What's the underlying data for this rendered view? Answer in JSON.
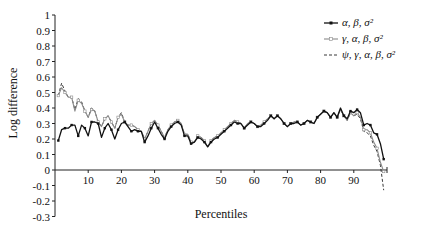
{
  "chart_data": {
    "type": "line",
    "title": "",
    "xlabel": "Percentiles",
    "ylabel": "Log difference",
    "xlim": [
      0,
      100
    ],
    "ylim": [
      -0.3,
      1.0
    ],
    "grid": false,
    "legend_position": "top-right",
    "x_ticks": [
      10,
      20,
      30,
      40,
      50,
      60,
      70,
      80,
      90
    ],
    "y_ticks": [
      1,
      0.9,
      0.8,
      0.7,
      0.6,
      0.5,
      0.4,
      0.3,
      0.2,
      0.1,
      0,
      -0.1,
      -0.2,
      -0.3
    ],
    "y_tick_labels": [
      "1",
      "0.9",
      "0.8",
      "0.7",
      "0.6",
      "0.5",
      "0.4",
      "0.3",
      "0.2",
      "0.1",
      "0",
      "-0.1",
      "-0.2",
      "-0.3"
    ],
    "x": [
      1,
      2,
      3,
      4,
      5,
      6,
      7,
      8,
      9,
      10,
      11,
      12,
      13,
      14,
      15,
      16,
      17,
      18,
      19,
      20,
      21,
      22,
      23,
      24,
      25,
      26,
      27,
      28,
      29,
      30,
      31,
      32,
      33,
      34,
      35,
      36,
      37,
      38,
      39,
      40,
      41,
      42,
      43,
      44,
      45,
      46,
      47,
      48,
      49,
      50,
      51,
      52,
      53,
      54,
      55,
      56,
      57,
      58,
      59,
      60,
      61,
      62,
      63,
      64,
      65,
      66,
      67,
      68,
      69,
      70,
      71,
      72,
      73,
      74,
      75,
      76,
      77,
      78,
      79,
      80,
      81,
      82,
      83,
      84,
      85,
      86,
      87,
      88,
      89,
      90,
      91,
      92,
      93,
      94,
      95,
      96,
      97,
      98,
      99
    ],
    "series": [
      {
        "name": "α, β, σ²",
        "style": "solid-square-marker",
        "values": [
          0.19,
          0.26,
          0.27,
          0.27,
          0.29,
          0.29,
          0.22,
          0.29,
          0.27,
          0.22,
          0.31,
          0.31,
          0.3,
          0.21,
          0.27,
          0.3,
          0.26,
          0.2,
          0.26,
          0.3,
          0.31,
          0.28,
          0.25,
          0.26,
          0.25,
          0.25,
          0.18,
          0.22,
          0.27,
          0.31,
          0.27,
          0.23,
          0.2,
          0.25,
          0.28,
          0.3,
          0.31,
          0.29,
          0.22,
          0.22,
          0.17,
          0.18,
          0.21,
          0.2,
          0.18,
          0.15,
          0.18,
          0.2,
          0.21,
          0.23,
          0.25,
          0.27,
          0.29,
          0.31,
          0.3,
          0.3,
          0.27,
          0.29,
          0.31,
          0.3,
          0.28,
          0.28,
          0.3,
          0.32,
          0.35,
          0.33,
          0.35,
          0.33,
          0.3,
          0.28,
          0.3,
          0.3,
          0.31,
          0.29,
          0.3,
          0.32,
          0.31,
          0.3,
          0.34,
          0.36,
          0.38,
          0.37,
          0.34,
          0.37,
          0.34,
          0.4,
          0.35,
          0.33,
          0.38,
          0.37,
          0.39,
          0.37,
          0.29,
          0.3,
          0.29,
          0.24,
          0.23,
          0.17,
          0.07
        ],
        "color": "#111111"
      },
      {
        "name": "γ, α, β, σ²",
        "style": "solid-gray-open-marker",
        "values": [
          0.48,
          0.53,
          0.5,
          0.47,
          0.47,
          0.38,
          0.45,
          0.43,
          0.38,
          0.34,
          0.39,
          0.38,
          0.31,
          0.28,
          0.33,
          0.35,
          0.31,
          0.27,
          0.34,
          0.36,
          0.31,
          0.29,
          0.29,
          0.28,
          0.26,
          0.25,
          0.2,
          0.25,
          0.3,
          0.32,
          0.29,
          0.25,
          0.21,
          0.26,
          0.29,
          0.31,
          0.32,
          0.3,
          0.23,
          0.23,
          0.18,
          0.18,
          0.22,
          0.21,
          0.19,
          0.15,
          0.19,
          0.21,
          0.22,
          0.24,
          0.26,
          0.28,
          0.3,
          0.32,
          0.31,
          0.3,
          0.27,
          0.3,
          0.31,
          0.3,
          0.28,
          0.29,
          0.31,
          0.33,
          0.35,
          0.33,
          0.35,
          0.33,
          0.3,
          0.28,
          0.3,
          0.31,
          0.31,
          0.29,
          0.3,
          0.32,
          0.31,
          0.3,
          0.34,
          0.36,
          0.38,
          0.37,
          0.34,
          0.37,
          0.34,
          0.39,
          0.35,
          0.32,
          0.37,
          0.35,
          0.37,
          0.34,
          0.26,
          0.26,
          0.24,
          0.18,
          0.14,
          0.05,
          -0.01
        ],
        "color": "#888888"
      },
      {
        "name": "ψ, γ, α, β, σ²",
        "style": "dashed",
        "values": [
          0.48,
          0.56,
          0.51,
          0.47,
          0.47,
          0.39,
          0.46,
          0.44,
          0.38,
          0.34,
          0.4,
          0.38,
          0.31,
          0.28,
          0.33,
          0.35,
          0.31,
          0.27,
          0.34,
          0.37,
          0.31,
          0.29,
          0.29,
          0.28,
          0.26,
          0.25,
          0.2,
          0.25,
          0.3,
          0.32,
          0.29,
          0.25,
          0.21,
          0.26,
          0.29,
          0.31,
          0.32,
          0.3,
          0.23,
          0.23,
          0.18,
          0.18,
          0.22,
          0.21,
          0.19,
          0.15,
          0.19,
          0.21,
          0.22,
          0.24,
          0.26,
          0.28,
          0.3,
          0.32,
          0.31,
          0.3,
          0.27,
          0.3,
          0.31,
          0.3,
          0.28,
          0.29,
          0.31,
          0.33,
          0.35,
          0.33,
          0.35,
          0.33,
          0.3,
          0.28,
          0.3,
          0.31,
          0.31,
          0.29,
          0.3,
          0.32,
          0.31,
          0.3,
          0.34,
          0.36,
          0.38,
          0.37,
          0.34,
          0.37,
          0.34,
          0.39,
          0.35,
          0.32,
          0.37,
          0.35,
          0.36,
          0.33,
          0.25,
          0.24,
          0.22,
          0.16,
          0.12,
          0.03,
          -0.13
        ],
        "color": "#222222"
      }
    ]
  },
  "legend": {
    "items": [
      "α, β, σ²",
      "γ, α, β, σ²",
      "ψ, γ, α, β, σ²"
    ]
  }
}
